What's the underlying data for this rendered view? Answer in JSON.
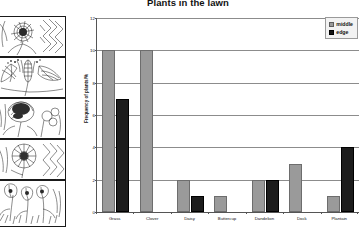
{
  "chart_data": {
    "type": "bar",
    "title": "Plants in the lawn",
    "xlabel": "",
    "ylabel": "Frequency of plants/%",
    "ylim": [
      0,
      12
    ],
    "yticks": [
      0,
      2,
      4,
      6,
      8,
      10,
      12
    ],
    "grid": true,
    "legend_position": "top-right",
    "categories": [
      "Grass",
      "Clover",
      "Daisy",
      "Buttercup",
      "Dandelion",
      "Dock",
      "Plantain"
    ],
    "series": [
      {
        "name": "middle",
        "color": "#9a9a9a",
        "values": [
          10,
          10,
          2,
          1,
          2,
          3,
          1
        ]
      },
      {
        "name": "edge",
        "color": "#1c1c1c",
        "values": [
          7,
          0,
          1,
          0,
          2,
          0,
          4
        ]
      }
    ]
  },
  "legend": {
    "items": [
      {
        "label": "middle"
      },
      {
        "label": "edge"
      }
    ]
  },
  "illustrations": {
    "panels": [
      {
        "name": "dandelion-flower-plate",
        "alt": "Dandelion flower line drawing"
      },
      {
        "name": "plantain-plate",
        "alt": "Plantain spike and leaves line drawing"
      },
      {
        "name": "clover-plate",
        "alt": "Clover flower head line drawing"
      },
      {
        "name": "daisy-plate",
        "alt": "Daisy flower line drawing"
      },
      {
        "name": "buttercup-plate",
        "alt": "Buttercup flowers line drawing"
      }
    ]
  }
}
